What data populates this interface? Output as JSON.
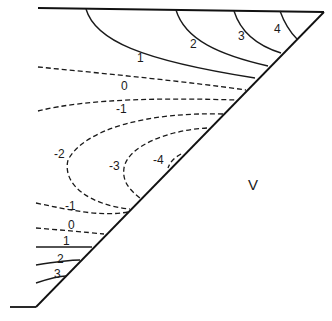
{
  "diagram": {
    "type": "contour wedge diagram",
    "region_label": "V",
    "positive_contours": {
      "upper": [
        "1",
        "2",
        "3",
        "4"
      ],
      "lower": [
        "1",
        "2",
        "3"
      ]
    },
    "zero_contours": [
      "0",
      "0"
    ],
    "negative_contours": {
      "upper": [
        "-1"
      ],
      "middle": [
        "-2",
        "-3",
        "-4"
      ],
      "lower": [
        "-1"
      ]
    },
    "labels": {
      "u1": "1",
      "u2": "2",
      "u3": "3",
      "u4": "4",
      "u0": "0",
      "um1": "-1",
      "m2": "-2",
      "m3": "-3",
      "m4": "-4",
      "lm1": "-1",
      "l0": "0",
      "l1": "1",
      "l2": "2",
      "l3": "3",
      "V": "V"
    },
    "line_styles": {
      "positive": "solid",
      "zero_and_negative": "dashed"
    },
    "stroke_color": "#1a1a1a",
    "background": "#ffffff"
  }
}
